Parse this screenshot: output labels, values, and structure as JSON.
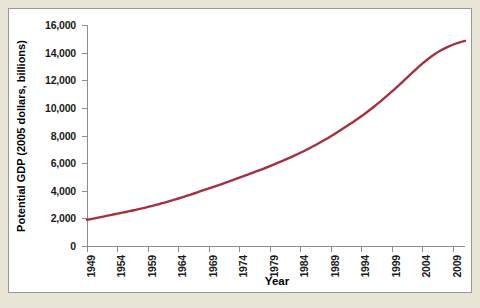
{
  "chart_data": {
    "type": "line",
    "title": "",
    "xlabel": "Year",
    "ylabel": "Potential GDP (2005 dollars, billions)",
    "xlim": [
      1949,
      2011
    ],
    "ylim": [
      0,
      16000
    ],
    "grid": false,
    "legend": null,
    "line_color": "#a5313f",
    "x_tick_labels": [
      "1949",
      "1954",
      "1959",
      "1964",
      "1969",
      "1974",
      "1979",
      "1984",
      "1989",
      "1994",
      "1999",
      "2004",
      "2009"
    ],
    "y_tick_labels": [
      "0",
      "2,000",
      "4,000",
      "6,000",
      "8,000",
      "10,000",
      "12,000",
      "14,000",
      "16,000"
    ],
    "y_tick_values": [
      0,
      2000,
      4000,
      6000,
      8000,
      10000,
      12000,
      14000,
      16000
    ],
    "series": [
      {
        "name": "Potential GDP",
        "x": [
          1949,
          1950,
          1951,
          1952,
          1953,
          1954,
          1955,
          1956,
          1957,
          1958,
          1959,
          1960,
          1961,
          1962,
          1963,
          1964,
          1965,
          1966,
          1967,
          1968,
          1969,
          1970,
          1971,
          1972,
          1973,
          1974,
          1975,
          1976,
          1977,
          1978,
          1979,
          1980,
          1981,
          1982,
          1983,
          1984,
          1985,
          1986,
          1987,
          1988,
          1989,
          1990,
          1991,
          1992,
          1993,
          1994,
          1995,
          1996,
          1997,
          1998,
          1999,
          2000,
          2001,
          2002,
          2003,
          2004,
          2005,
          2006,
          2007,
          2008,
          2009,
          2010,
          2011
        ],
        "values": [
          1900,
          1980,
          2070,
          2160,
          2250,
          2340,
          2430,
          2520,
          2620,
          2720,
          2830,
          2940,
          3060,
          3180,
          3310,
          3440,
          3580,
          3720,
          3870,
          4020,
          4170,
          4320,
          4470,
          4630,
          4790,
          4950,
          5110,
          5270,
          5440,
          5610,
          5790,
          5970,
          6150,
          6340,
          6540,
          6750,
          6970,
          7200,
          7440,
          7690,
          7950,
          8220,
          8500,
          8790,
          9090,
          9400,
          9720,
          10060,
          10420,
          10790,
          11180,
          11580,
          11990,
          12400,
          12810,
          13200,
          13560,
          13880,
          14150,
          14380,
          14570,
          14720,
          14850
        ]
      }
    ]
  }
}
